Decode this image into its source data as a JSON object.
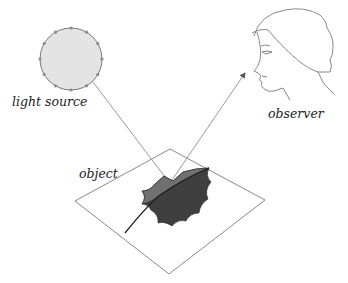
{
  "labels": {
    "light_source": "light source",
    "observer": "observer",
    "object": "object"
  },
  "colors": {
    "background": "#ffffff",
    "line": "#8a8a8a",
    "light_fill": "#e4e4e4",
    "light_stroke": "#7a7a7a",
    "leaf_light": "#6e6e6e",
    "leaf_dark": "#3c3c3c",
    "text": "#222222"
  }
}
